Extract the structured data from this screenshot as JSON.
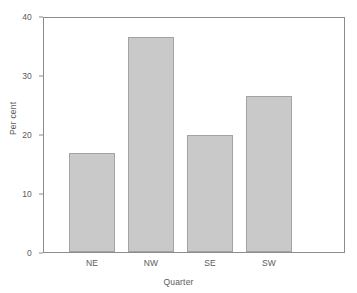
{
  "chart_data": {
    "type": "bar",
    "title": "",
    "subtitle": "",
    "xlabel": "Quarter",
    "ylabel": "Per cent",
    "categories": [
      "NE",
      "NW",
      "SE",
      "SW"
    ],
    "values": [
      16.9,
      36.8,
      20.0,
      26.6
    ],
    "series": [
      {
        "name": "Per cent",
        "values": [
          16.9,
          36.8,
          20.0,
          26.6
        ]
      }
    ],
    "ylim": [
      0,
      40
    ],
    "yticks": [
      0,
      10,
      20,
      30,
      40
    ],
    "ytick_labels": [
      "0",
      "10",
      "20",
      "30",
      "40"
    ],
    "xtick_labels": [
      "NE",
      "NW",
      "SE",
      "SW"
    ],
    "grid": false,
    "legend": false,
    "legend_position": "none",
    "bar_color": "#c9c9c9",
    "bar_border_color": "#a3a3a3",
    "axis_color": "#8c8c8c",
    "text_color": "#5a5a5a",
    "background_color": "#ffffff"
  }
}
